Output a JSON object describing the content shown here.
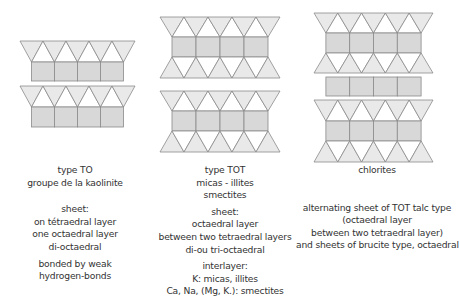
{
  "colors": {
    "tetra_fill": "#e9e9e9",
    "octa_fill": "#d8d8d8",
    "stroke": "#8a8a8a",
    "text": "#333333"
  },
  "columns": [
    {
      "id": "to",
      "title_lines": [
        "type TO",
        "groupe de la kaolinite"
      ],
      "sheet_lines": [
        "sheet:",
        "on tétraedral layer",
        "one octaedral layer",
        "di-octaedral"
      ],
      "bond_lines": [
        "bonded by weak",
        "hydrogen-bonds"
      ],
      "structure": [
        "T",
        "O",
        "T",
        "O"
      ]
    },
    {
      "id": "tot",
      "title_lines": [
        "type TOT",
        "micas - illites",
        "smectites"
      ],
      "sheet_lines": [
        "sheet:",
        "octaedral layer",
        "between two tetraedral layers",
        "di-ou tri-octaedral"
      ],
      "interlayer_lines": [
        "interlayer:",
        "K: micas, illites",
        "Ca, Na, (Mg, K.): smectites"
      ],
      "structure": [
        "T",
        "O",
        "T",
        "T",
        "O",
        "T"
      ]
    },
    {
      "id": "chlorites",
      "title_lines": [
        "chlorites"
      ],
      "description_lines": [
        "alternating sheet of TOT talc type",
        "(octaedral layer",
        "between two tetraedral layer)",
        "and sheets of brucite type, octaedral"
      ],
      "structure": [
        "T",
        "O",
        "T",
        "O",
        "T",
        "O",
        "T"
      ]
    }
  ]
}
